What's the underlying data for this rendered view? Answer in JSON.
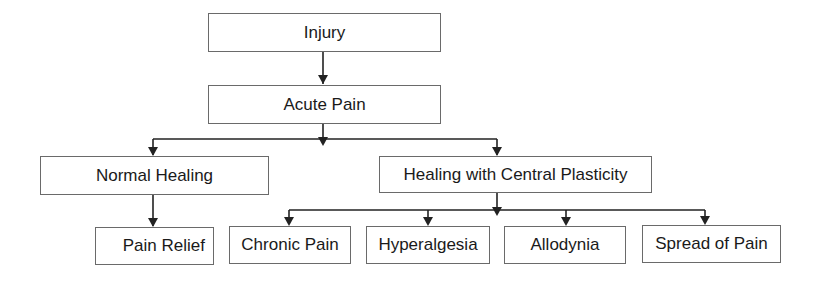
{
  "diagram": {
    "type": "flowchart",
    "nodes": {
      "injury": "Injury",
      "acute_pain": "Acute Pain",
      "normal_healing": "Normal Healing",
      "healing_central_plasticity": "Healing with Central Plasticity",
      "pain_relief": "Pain Relief",
      "chronic_pain": "Chronic Pain",
      "hyperalgesia": "Hyperalgesia",
      "allodynia": "Allodynia",
      "spread_of_pain": "Spread of Pain"
    },
    "edges": [
      [
        "Injury",
        "Acute Pain"
      ],
      [
        "Acute Pain",
        "Normal Healing"
      ],
      [
        "Acute Pain",
        "Healing with Central Plasticity"
      ],
      [
        "Normal Healing",
        "Pain Relief"
      ],
      [
        "Healing with Central Plasticity",
        "Chronic Pain"
      ],
      [
        "Healing with Central Plasticity",
        "Hyperalgesia"
      ],
      [
        "Healing with Central Plasticity",
        "Allodynia"
      ],
      [
        "Healing with Central Plasticity",
        "Spread of Pain"
      ]
    ],
    "colors": {
      "line": "#222222",
      "border": "#6a6a6a",
      "text": "#1a1a1a"
    }
  }
}
